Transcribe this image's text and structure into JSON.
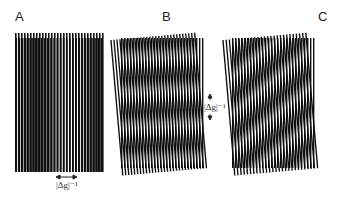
{
  "panels": [
    {
      "id": "A",
      "label": "A",
      "description": "Two parallel vertical gratings with slightly different periods",
      "annotation": "|Δg|⁻¹",
      "annotation_orientation": "horizontal"
    },
    {
      "id": "B",
      "label": "B",
      "description": "Two gratings with same period, one slightly rotated",
      "annotation": "|Δg|⁻¹",
      "annotation_orientation": "vertical"
    },
    {
      "id": "C",
      "label": "C",
      "description": "Two gratings with different periods and relative rotation"
    }
  ],
  "colors": {
    "line": "#111111",
    "background": "#ffffff"
  }
}
